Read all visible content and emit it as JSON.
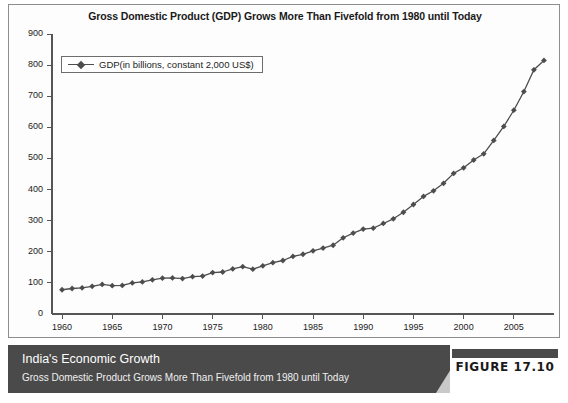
{
  "figure": {
    "caption_title": "India's Economic Growth",
    "caption_subtitle": "Gross Domestic Product Grows More Than Fivefold from 1980 until Today",
    "figure_number": "FIGURE 17.10"
  },
  "colors": {
    "series_line": "#4d4d4d",
    "axis": "#555555",
    "caption_background": "#4a4a4a",
    "caption_text": "#ffffff",
    "panel_border": "#8d8d8d",
    "plot_background": "#fdfdfd"
  },
  "chart_data": {
    "type": "line",
    "title": "Gross Domestic Product (GDP) Grows More Than Fivefold from 1980 until Today",
    "xlabel": "",
    "ylabel": "",
    "xlim": [
      1959,
      2009
    ],
    "ylim": [
      0,
      900
    ],
    "yticks": [
      0,
      100,
      200,
      300,
      400,
      500,
      600,
      700,
      800,
      900
    ],
    "ytick_labels": [
      "0",
      "100",
      "200",
      "300",
      "400",
      "500",
      "600",
      "700",
      "800",
      "900"
    ],
    "xticks": [
      1960,
      1965,
      1970,
      1975,
      1980,
      1985,
      1990,
      1995,
      2000,
      2005
    ],
    "xtick_labels": [
      "1960",
      "1965",
      "1970",
      "1975",
      "1980",
      "1985",
      "1990",
      "1995",
      "2000",
      "2005"
    ],
    "grid": false,
    "legend_position": "upper-left",
    "legend": [
      "GDP(in billions, constant 2,000 US$)"
    ],
    "marker": "diamond",
    "series": [
      {
        "name": "GDP(in billions, constant 2,000 US$)",
        "x": [
          1960,
          1961,
          1962,
          1963,
          1964,
          1965,
          1966,
          1967,
          1968,
          1969,
          1970,
          1971,
          1972,
          1973,
          1974,
          1975,
          1976,
          1977,
          1978,
          1979,
          1980,
          1981,
          1982,
          1983,
          1984,
          1985,
          1986,
          1987,
          1988,
          1989,
          1990,
          1991,
          1992,
          1993,
          1994,
          1995,
          1996,
          1997,
          1998,
          1999,
          2000,
          2001,
          2002,
          2003,
          2004,
          2005,
          2006,
          2007,
          2008
        ],
        "values": [
          78,
          82,
          84,
          89,
          95,
          91,
          92,
          100,
          103,
          110,
          115,
          116,
          114,
          120,
          122,
          133,
          135,
          145,
          152,
          144,
          155,
          165,
          172,
          185,
          192,
          203,
          212,
          221,
          245,
          260,
          273,
          276,
          291,
          306,
          327,
          352,
          378,
          396,
          420,
          452,
          470,
          495,
          515,
          558,
          603,
          655,
          715,
          785,
          815
        ]
      }
    ]
  }
}
